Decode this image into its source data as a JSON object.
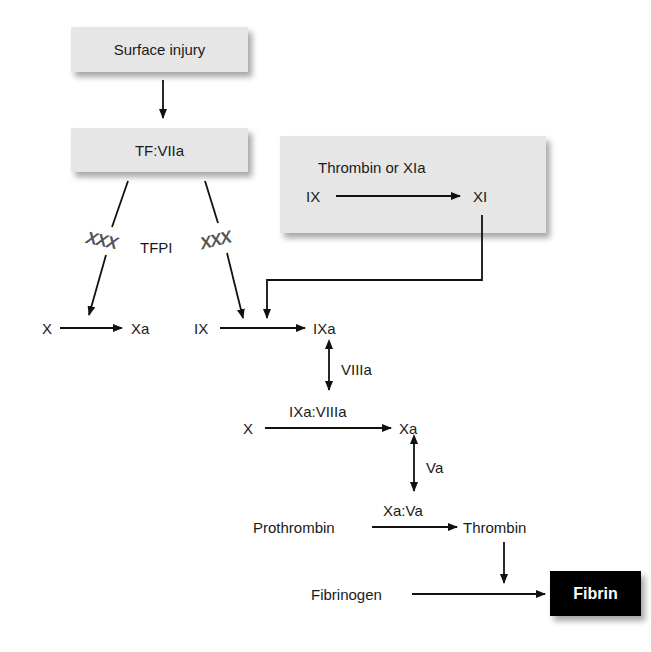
{
  "diagram": {
    "type": "coagulation-cascade",
    "boxes": {
      "surface_injury": "Surface injury",
      "tf_viia": "TF:VIIa",
      "intrinsic_title": "Thrombin or XIa",
      "intrinsic_from": "IX",
      "intrinsic_to": "XI",
      "fibrin": "Fibrin"
    },
    "inhibition": {
      "mark": "XXX",
      "inhibitor": "TFPI"
    },
    "nodes": {
      "x1": "X",
      "xa1": "Xa",
      "ix": "IX",
      "ixa": "IXa",
      "viiia": "VIIIa",
      "x2": "X",
      "ixa_viiia": "IXa:VIIIa",
      "xa2": "Xa",
      "va": "Va",
      "prothrombin": "Prothrombin",
      "xa_va": "Xa:Va",
      "thrombin": "Thrombin",
      "fibrinogen": "Fibrinogen"
    },
    "colors": {
      "box_fill": "#e6e6e6",
      "fibrin_fill": "#000000",
      "fibrin_text": "#ffffff",
      "inhibition_mark": "#555555"
    }
  }
}
